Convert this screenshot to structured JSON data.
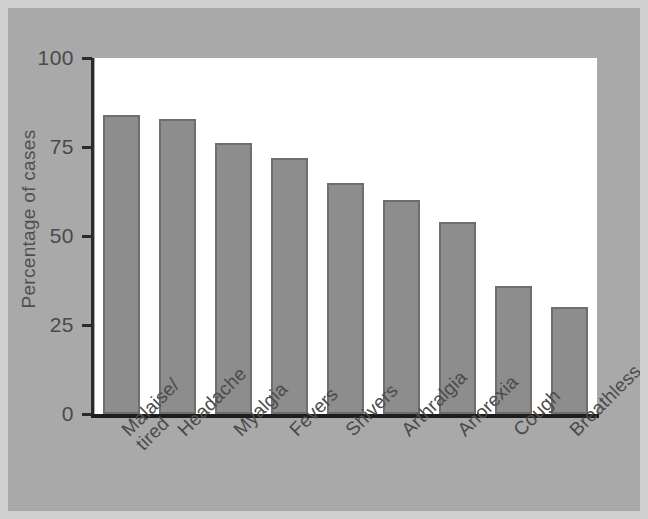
{
  "chart_data": {
    "type": "bar",
    "title": "",
    "xlabel": "",
    "ylabel": "Percentage of cases",
    "ylim": [
      0,
      100
    ],
    "yticks": [
      "0",
      "25",
      "50",
      "75",
      "100"
    ],
    "ytick_values": [
      0,
      25,
      50,
      75,
      100
    ],
    "grid": false,
    "legend": null,
    "bar_color": "#8d8d8d",
    "bar_border_color": "#6e6e6e",
    "plot_background": "#ffffff",
    "figure_background": "#a9a9a9",
    "categories": [
      "Malaise/\ntired",
      "Headache",
      "Myalgia",
      "Fevers",
      "Shivers",
      "Arthralgia",
      "Anorexia",
      "Cough",
      "Breathless"
    ],
    "values": [
      84,
      83,
      76,
      72,
      65,
      60,
      54,
      36,
      30
    ]
  }
}
